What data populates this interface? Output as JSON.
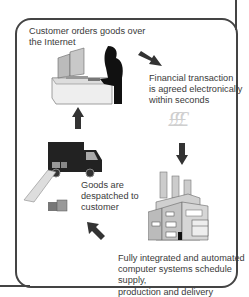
{
  "diagram": {
    "title": "",
    "steps": [
      {
        "id": "order",
        "label_lines": [
          "Customer orders goods over",
          "the Internet"
        ],
        "icon": "customer-at-computer-icon"
      },
      {
        "id": "transaction",
        "label_lines": [
          "Financial transaction",
          "is agreed electronically",
          "within seconds"
        ],
        "icon": "pound-sign-icon"
      },
      {
        "id": "production",
        "label_lines": [
          "Fully integrated and automated",
          "computer systems schedule supply,",
          "production and delivery"
        ],
        "icon": "factory-icon"
      },
      {
        "id": "despatch",
        "label_lines": [
          "Goods are",
          "despatched to",
          "customer"
        ],
        "icon": "delivery-truck-icon"
      }
    ],
    "currency_symbols": "£££",
    "flow": [
      "order",
      "transaction",
      "production",
      "despatch",
      "order"
    ],
    "colors": {
      "frame": "#444444",
      "text": "#3a3a3a",
      "arrow": "#333333",
      "currency": "#cfcfcf"
    }
  }
}
